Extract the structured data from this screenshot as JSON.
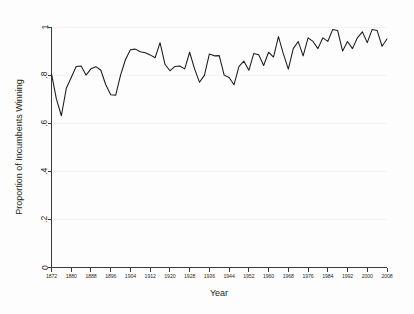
{
  "chart_data": {
    "type": "line",
    "title": "",
    "xlabel": "Year",
    "ylabel": "Proportion of Incumbents Winning",
    "xlim": [
      1872,
      2008
    ],
    "ylim": [
      0,
      1
    ],
    "grid": true,
    "legend": "none",
    "x_tick_labels": [
      "1872",
      "1880",
      "1888",
      "1896",
      "1904",
      "1912",
      "1920",
      "1928",
      "1936",
      "1944",
      "1952",
      "1960",
      "1968",
      "1976",
      "1984",
      "1992",
      "2000",
      "2008"
    ],
    "x_tick_values": [
      1872,
      1880,
      1888,
      1896,
      1904,
      1912,
      1920,
      1928,
      1936,
      1944,
      1952,
      1960,
      1968,
      1976,
      1984,
      1992,
      2000,
      2008
    ],
    "y_tick_labels": [
      "0",
      ".2",
      ".4",
      ".6",
      ".8",
      "1"
    ],
    "y_tick_values": [
      0,
      0.2,
      0.4,
      0.6,
      0.8,
      1
    ],
    "series": [
      {
        "name": "Proportion of Incumbents Winning",
        "color": "#1a1a1a",
        "x": [
          1872,
          1874,
          1876,
          1878,
          1880,
          1882,
          1884,
          1886,
          1888,
          1890,
          1892,
          1894,
          1896,
          1898,
          1900,
          1902,
          1904,
          1906,
          1908,
          1910,
          1912,
          1914,
          1916,
          1918,
          1920,
          1922,
          1924,
          1926,
          1928,
          1930,
          1932,
          1934,
          1936,
          1938,
          1940,
          1942,
          1944,
          1946,
          1948,
          1950,
          1952,
          1954,
          1956,
          1958,
          1960,
          1962,
          1964,
          1966,
          1968,
          1970,
          1972,
          1974,
          1976,
          1978,
          1980,
          1982,
          1984,
          1986,
          1988,
          1990,
          1992,
          1994,
          1996,
          1998,
          2000,
          2002,
          2004,
          2006,
          2008
        ],
        "y": [
          0.805,
          0.7,
          0.631,
          0.745,
          0.79,
          0.836,
          0.838,
          0.8,
          0.826,
          0.835,
          0.82,
          0.76,
          0.718,
          0.716,
          0.8,
          0.865,
          0.905,
          0.908,
          0.897,
          0.893,
          0.884,
          0.872,
          0.935,
          0.845,
          0.818,
          0.836,
          0.838,
          0.826,
          0.895,
          0.826,
          0.77,
          0.8,
          0.888,
          0.88,
          0.881,
          0.8,
          0.79,
          0.76,
          0.836,
          0.858,
          0.82,
          0.89,
          0.885,
          0.84,
          0.895,
          0.875,
          0.96,
          0.888,
          0.825,
          0.91,
          0.94,
          0.88,
          0.955,
          0.94,
          0.91,
          0.955,
          0.94,
          0.99,
          0.985,
          0.9,
          0.94,
          0.91,
          0.955,
          0.98,
          0.935,
          0.99,
          0.985,
          0.92,
          0.95
        ]
      }
    ]
  },
  "axes": {
    "y_title": "Proportion of Incumbents Winning",
    "x_title": "Year"
  }
}
